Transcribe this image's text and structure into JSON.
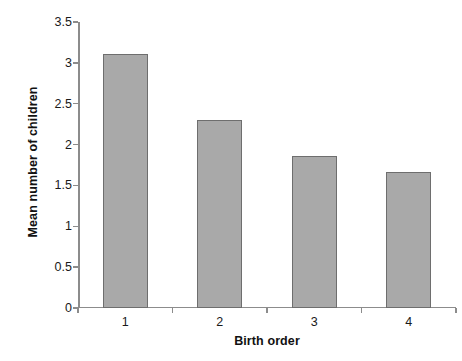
{
  "chart_data": {
    "type": "bar",
    "title": "",
    "subtitle": "",
    "xlabel": "Birth order",
    "ylabel": "Mean number of children",
    "categories": [
      "1",
      "2",
      "3",
      "4"
    ],
    "values": [
      3.11,
      2.3,
      1.86,
      1.66
    ],
    "series": [
      {
        "name": "Mean number of children",
        "values": [
          3.11,
          2.3,
          1.86,
          1.66
        ]
      }
    ],
    "ylim": [
      0,
      3.5
    ],
    "yticks": [
      "0",
      "0.5",
      "1",
      "1.5",
      "2",
      "2.5",
      "3",
      "3.5"
    ],
    "ytick_values": [
      0,
      0.5,
      1,
      1.5,
      2,
      2.5,
      3,
      3.5
    ],
    "xtick_labels": [
      "1",
      "2",
      "3",
      "4"
    ],
    "grid": false,
    "legend": false,
    "legend_position": "none",
    "annotations": [],
    "colors": {
      "bar_fill": "#a9a9a9",
      "bar_border": "#6e6e6e",
      "axis": "#8c8c8c",
      "text": "#111111",
      "background": "#ffffff"
    }
  }
}
